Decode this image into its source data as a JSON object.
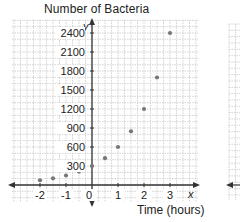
{
  "chart_data": {
    "type": "scatter",
    "title": "Number of Bacteria",
    "xlabel": "Time (hours)",
    "ylabel": "y",
    "x_axis_var": "x",
    "y_axis_var": "y",
    "xlim": [
      -3,
      4
    ],
    "ylim": [
      -300,
      2600
    ],
    "grid": true,
    "x_ticks": [
      "-2",
      "-1",
      "0",
      "1",
      "2",
      "3"
    ],
    "y_ticks": [
      "300",
      "600",
      "900",
      "1200",
      "1500",
      "1800",
      "2100",
      "2400"
    ],
    "series": [
      {
        "name": "Number of Bacteria",
        "x": [
          -2,
          -1.5,
          -1,
          -0.5,
          0,
          0.5,
          1,
          1.5,
          2,
          2.5,
          3
        ],
        "y": [
          75,
          106,
          150,
          212,
          300,
          424,
          600,
          849,
          1200,
          1697,
          2400
        ]
      }
    ]
  },
  "labels": {
    "title": "Number of Bacteria",
    "xlabel": "Time (hours)",
    "x_var": "x",
    "y_var": "y",
    "x_ticks": [
      "-2",
      "-1",
      "0",
      "1",
      "2",
      "3"
    ],
    "y_ticks": [
      "2400",
      "2100",
      "1800",
      "1500",
      "1200",
      "900",
      "600",
      "300"
    ]
  },
  "colors": {
    "grid": "#b8b8b8",
    "axis": "#333333",
    "point": "#777777"
  }
}
